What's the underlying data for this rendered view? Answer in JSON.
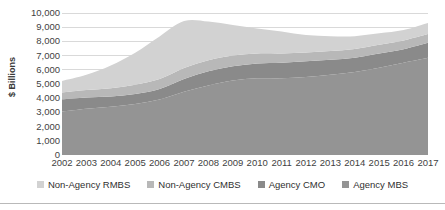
{
  "chart_data": {
    "type": "area",
    "stacked": true,
    "title": "",
    "subtitle": "",
    "xlabel": "",
    "ylabel": "$ Billions",
    "ylim": [
      0,
      10000
    ],
    "ytick_labels": [
      "10,000",
      "9,000",
      "8,000",
      "7,000",
      "6,000",
      "5,000",
      "4,000",
      "3,000",
      "2,000",
      "1,000",
      "0"
    ],
    "ytick_values": [
      10000,
      9000,
      8000,
      7000,
      6000,
      5000,
      4000,
      3000,
      2000,
      1000,
      0
    ],
    "grid": true,
    "legend_position": "bottom",
    "categories": [
      "2002",
      "2003",
      "2004",
      "2005",
      "2006",
      "2007",
      "2008",
      "2009",
      "2010",
      "2011",
      "2012",
      "2013",
      "2014",
      "2015",
      "2016",
      "2017"
    ],
    "series": [
      {
        "name": "Agency MBS",
        "color": "#949494",
        "values": [
          3050,
          3250,
          3400,
          3600,
          3900,
          4450,
          4900,
          5250,
          5400,
          5400,
          5500,
          5650,
          5850,
          6150,
          6500,
          6850
        ]
      },
      {
        "name": "Agency CMO",
        "color": "#8a8a8a",
        "values": [
          870,
          800,
          720,
          700,
          750,
          900,
          1000,
          1000,
          1050,
          1100,
          1100,
          1050,
          1000,
          1000,
          950,
          1050
        ]
      },
      {
        "name": "Non-Agency CMBS",
        "color": "#b8b8b8",
        "values": [
          480,
          520,
          580,
          650,
          700,
          780,
          780,
          760,
          700,
          650,
          620,
          620,
          620,
          620,
          620,
          620
        ]
      },
      {
        "name": "Non-Agency RMBS",
        "color": "#d2d2d2",
        "values": [
          820,
          1080,
          1600,
          2250,
          3000,
          3300,
          2720,
          2140,
          1750,
          1550,
          1230,
          1050,
          900,
          800,
          730,
          780
        ]
      }
    ],
    "totals": [
      5220,
      5650,
      6300,
      7200,
      8350,
      9430,
      9400,
      9150,
      8900,
      8700,
      8450,
      8370,
      8370,
      8570,
      8800,
      9300
    ]
  },
  "legend": {
    "items": [
      {
        "label": "Non-Agency RMBS",
        "color": "#d2d2d2"
      },
      {
        "label": "Non-Agency CMBS",
        "color": "#b8b8b8"
      },
      {
        "label": "Agency CMO",
        "color": "#8a8a8a"
      },
      {
        "label": "Agency MBS",
        "color": "#949494"
      }
    ]
  },
  "colors": {
    "gridline": "#d9d9d9",
    "axis_text": "#3f3f3f",
    "footer_rule": "#b9b9b9",
    "background": "#ffffff"
  }
}
